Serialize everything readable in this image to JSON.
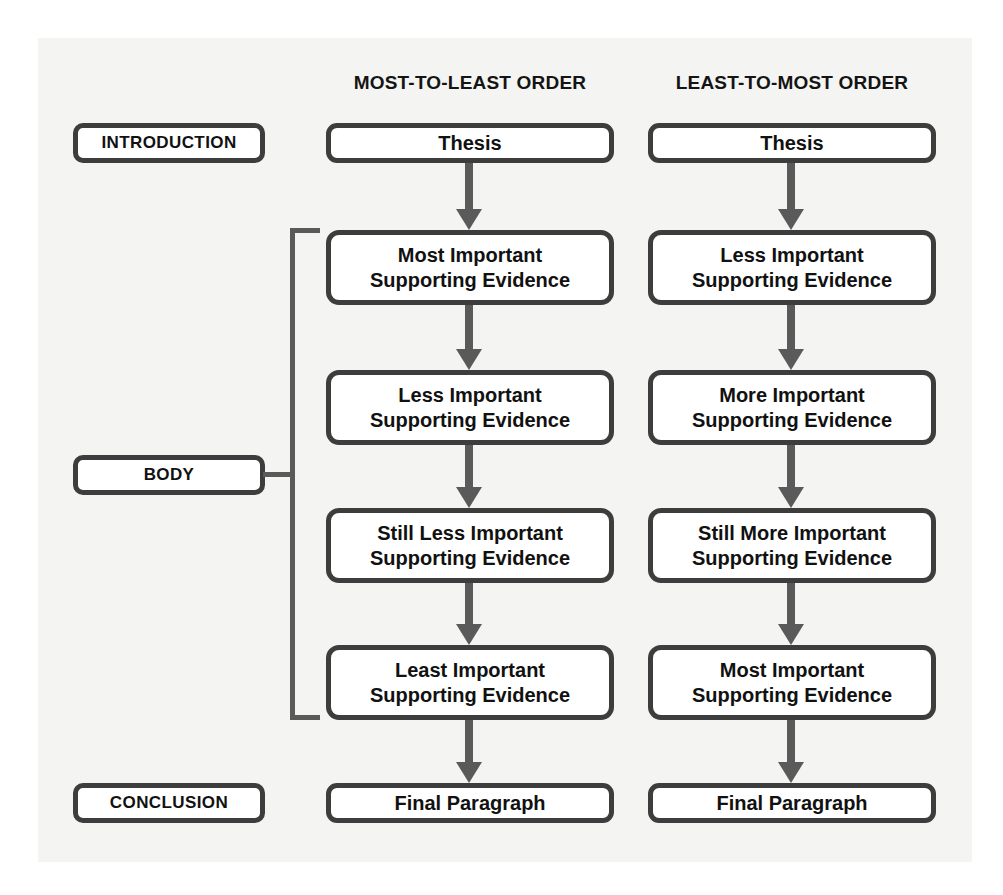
{
  "figure": {
    "background_color": "#f4f4f2",
    "box_border_color": "#3d3d3d",
    "connector_color": "#5a5a5a"
  },
  "section_labels": [
    {
      "id": "introduction",
      "label": "INTRODUCTION"
    },
    {
      "id": "body",
      "label": "BODY"
    },
    {
      "id": "conclusion",
      "label": "CONCLUSION"
    }
  ],
  "columns": [
    {
      "id": "most-to-least",
      "header": "MOST-TO-LEAST ORDER",
      "steps": [
        {
          "id": "thesis",
          "lines": [
            "Thesis"
          ]
        },
        {
          "id": "evidence-1",
          "lines": [
            "Most Important",
            "Supporting Evidence"
          ]
        },
        {
          "id": "evidence-2",
          "lines": [
            "Less Important",
            "Supporting Evidence"
          ]
        },
        {
          "id": "evidence-3",
          "lines": [
            "Still Less Important",
            "Supporting Evidence"
          ]
        },
        {
          "id": "evidence-4",
          "lines": [
            "Least Important",
            "Supporting Evidence"
          ]
        },
        {
          "id": "final-paragraph",
          "lines": [
            "Final Paragraph"
          ]
        }
      ]
    },
    {
      "id": "least-to-most",
      "header": "LEAST-TO-MOST ORDER",
      "steps": [
        {
          "id": "thesis",
          "lines": [
            "Thesis"
          ]
        },
        {
          "id": "evidence-1",
          "lines": [
            "Less Important",
            "Supporting Evidence"
          ]
        },
        {
          "id": "evidence-2",
          "lines": [
            "More Important",
            "Supporting Evidence"
          ]
        },
        {
          "id": "evidence-3",
          "lines": [
            "Still More Important",
            "Supporting Evidence"
          ]
        },
        {
          "id": "evidence-4",
          "lines": [
            "Most Important",
            "Supporting Evidence"
          ]
        },
        {
          "id": "final-paragraph",
          "lines": [
            "Final Paragraph"
          ]
        }
      ]
    }
  ]
}
